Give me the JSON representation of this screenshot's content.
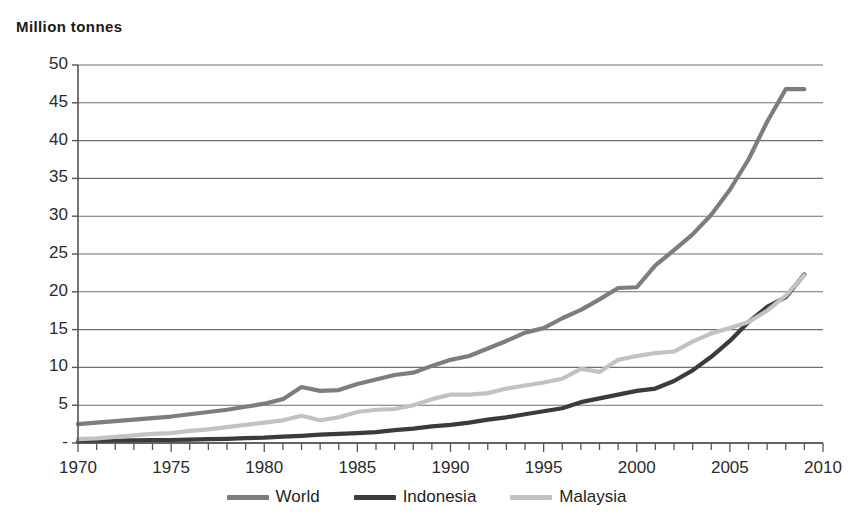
{
  "chart_data": {
    "type": "line",
    "title": "Million tonnes",
    "xlabel": "",
    "ylabel": "Million tonnes",
    "xlim": [
      1970,
      2010
    ],
    "ylim": [
      0,
      50
    ],
    "grid": true,
    "legend_position": "bottom",
    "ytick_labels": [
      "50",
      "45",
      "40",
      "35",
      "30",
      "25",
      "20",
      "15",
      "10",
      "5",
      "-"
    ],
    "ytick_values": [
      50,
      45,
      40,
      35,
      30,
      25,
      20,
      15,
      10,
      5,
      0
    ],
    "xtick_labels": [
      "1970",
      "1975",
      "1980",
      "1985",
      "1990",
      "1995",
      "2000",
      "2005",
      "2010"
    ],
    "xtick_values": [
      1970,
      1975,
      1980,
      1985,
      1990,
      1995,
      2000,
      2005,
      2010
    ],
    "x": [
      1970,
      1971,
      1972,
      1973,
      1974,
      1975,
      1976,
      1977,
      1978,
      1979,
      1980,
      1981,
      1982,
      1983,
      1984,
      1985,
      1986,
      1987,
      1988,
      1989,
      1990,
      1991,
      1992,
      1993,
      1994,
      1995,
      1996,
      1997,
      1998,
      1999,
      2000,
      2001,
      2002,
      2003,
      2004,
      2005,
      2006,
      2007,
      2008,
      2009
    ],
    "series": [
      {
        "name": "World",
        "color": "#7d7d7d",
        "values": [
          2.5,
          2.7,
          2.9,
          3.1,
          3.3,
          3.5,
          3.8,
          4.1,
          4.4,
          4.8,
          5.2,
          5.8,
          7.4,
          6.9,
          7.0,
          7.8,
          8.4,
          9.0,
          9.3,
          10.2,
          11.0,
          11.5,
          12.5,
          13.5,
          14.6,
          15.2,
          16.5,
          17.6,
          19.0,
          20.5,
          20.6,
          23.5,
          25.5,
          27.6,
          30.2,
          33.5,
          37.5,
          42.5,
          46.8,
          46.8
        ]
      },
      {
        "name": "Indonesia",
        "color": "#3b3b3b",
        "values": [
          0.2,
          0.25,
          0.3,
          0.35,
          0.4,
          0.4,
          0.45,
          0.5,
          0.55,
          0.65,
          0.7,
          0.85,
          0.95,
          1.1,
          1.2,
          1.3,
          1.45,
          1.7,
          1.9,
          2.2,
          2.4,
          2.7,
          3.1,
          3.4,
          3.8,
          4.2,
          4.6,
          5.4,
          5.9,
          6.4,
          6.9,
          7.2,
          8.2,
          9.6,
          11.4,
          13.5,
          16.0,
          18.0,
          19.3,
          22.3
        ]
      },
      {
        "name": "Malaysia",
        "color": "#c2c2c2",
        "values": [
          0.5,
          0.6,
          0.8,
          1.0,
          1.2,
          1.3,
          1.6,
          1.8,
          2.1,
          2.4,
          2.7,
          3.0,
          3.6,
          3.0,
          3.4,
          4.1,
          4.4,
          4.5,
          5.0,
          5.8,
          6.4,
          6.4,
          6.6,
          7.2,
          7.6,
          8.0,
          8.5,
          9.8,
          9.4,
          11.0,
          11.5,
          11.9,
          12.1,
          13.4,
          14.5,
          15.2,
          16.0,
          17.5,
          19.5,
          22.2
        ]
      }
    ]
  }
}
